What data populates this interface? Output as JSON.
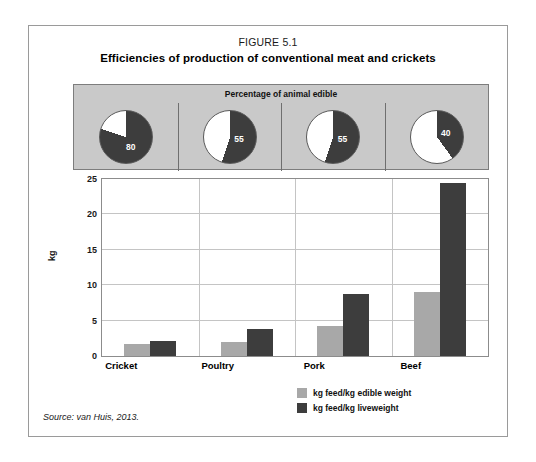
{
  "figure": {
    "number": "FIGURE 5.1",
    "title": "Efficiencies of production of conventional meat and crickets",
    "source": "Source: van Huis, 2013."
  },
  "pie_panel": {
    "title": "Percentage of animal edible",
    "items": [
      {
        "category": "Cricket",
        "value": 80,
        "label": "80"
      },
      {
        "category": "Poultry",
        "value": 55,
        "label": "55"
      },
      {
        "category": "Pork",
        "value": 55,
        "label": "55"
      },
      {
        "category": "Beef",
        "value": 40,
        "label": "40"
      }
    ],
    "colors": {
      "filled": "#3d3d3d",
      "empty": "#ffffff",
      "panel": "#c9c9c9"
    }
  },
  "chart_data": {
    "type": "bar",
    "title": "Efficiencies of production of conventional meat and crickets",
    "xlabel": "",
    "ylabel": "kg",
    "ylim": [
      0,
      25
    ],
    "yticks": [
      0,
      5,
      10,
      15,
      20,
      25
    ],
    "ytick_labels": [
      "0",
      "5",
      "10",
      "15",
      "20",
      "25"
    ],
    "grid": true,
    "legend_position": "bottom-right",
    "categories": [
      "Cricket",
      "Poultry",
      "Pork",
      "Beef"
    ],
    "series": [
      {
        "name": "kg feed/kg edible weight",
        "color": "#a8a8a8",
        "values": [
          1.7,
          2.0,
          4.2,
          9.0
        ]
      },
      {
        "name": "kg feed/kg liveweight",
        "color": "#3d3d3d",
        "values": [
          2.1,
          3.8,
          8.8,
          24.4
        ]
      }
    ]
  },
  "legend": {
    "entries": [
      {
        "label": "kg feed/kg edible weight",
        "color": "#a8a8a8"
      },
      {
        "label": "kg feed/kg liveweight",
        "color": "#3d3d3d"
      }
    ]
  }
}
